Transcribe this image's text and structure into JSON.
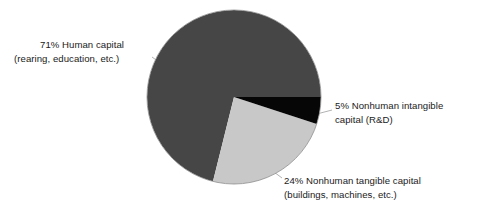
{
  "chart_data": {
    "type": "pie",
    "title": "",
    "subtitle": "",
    "xlabel": "",
    "ylabel": "",
    "legend_position": "none",
    "grid": false,
    "units": "percent",
    "categories": [
      "Human capital (rearing, education, etc.)",
      "Nonhuman tangible capital (buildings, machines, etc.)",
      "Nonhuman intangible capital (R&D)"
    ],
    "values": [
      71,
      24,
      5
    ],
    "colors": [
      "#464646",
      "#c8c8c8",
      "#060606"
    ],
    "slices": [
      {
        "name": "human-capital",
        "percent": 71,
        "percent_text": "71%",
        "label_line1": "71% Human capital",
        "label_line2": "(rearing, education, etc.)",
        "color": "#464646",
        "start_angle_deg": 104,
        "end_angle_deg": 360
      },
      {
        "name": "nonhuman-tangible-capital",
        "percent": 24,
        "percent_text": "24%",
        "label_line1": "24% Nonhuman tangible capital",
        "label_line2": "(buildings, machines, etc.)",
        "color": "#c8c8c8",
        "start_angle_deg": 18,
        "end_angle_deg": 104
      },
      {
        "name": "nonhuman-intangible-capital",
        "percent": 5,
        "percent_text": "5%",
        "label_line1": "5% Nonhuman intangible",
        "label_line2": "capital (R&D)",
        "color": "#060606",
        "start_angle_deg": 0,
        "end_angle_deg": 18
      }
    ]
  },
  "labels": {
    "human": {
      "line1": "71% Human capital",
      "line2": "(rearing, education, etc.)"
    },
    "intangible": {
      "line1": "5% Nonhuman intangible",
      "line2": "capital (R&D)"
    },
    "tangible": {
      "line1": "24% Nonhuman tangible capital",
      "line2": "(buildings, machines, etc.)"
    }
  },
  "style": {
    "background": "#ffffff",
    "text_color": "#1a1a1a",
    "leader_line_color": "#a8a8a8",
    "pie_edge_color": "#8c8c8c"
  }
}
